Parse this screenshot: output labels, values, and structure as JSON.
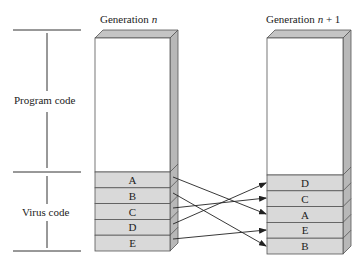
{
  "diagram": {
    "left_column": {
      "title": "Generation ",
      "title_var": "n",
      "blocks": [
        "A",
        "B",
        "C",
        "D",
        "E"
      ]
    },
    "right_column": {
      "title": "Generation ",
      "title_var": "n",
      "title_suffix": " + 1",
      "blocks": [
        "D",
        "C",
        "A",
        "E",
        "B"
      ]
    },
    "brackets": {
      "program_code": "Program code",
      "virus_code": "Virus code"
    },
    "arrows": [
      {
        "from": "A",
        "to": "A"
      },
      {
        "from": "B",
        "to": "B"
      },
      {
        "from": "C",
        "to": "C"
      },
      {
        "from": "D",
        "to": "D"
      },
      {
        "from": "E",
        "to": "E"
      }
    ],
    "colors": {
      "block_fill": "#d9d9d9",
      "side_fill": "#b8b8b8",
      "top_fill": "#c4c4c4",
      "outline": "#555555",
      "line": "#333333"
    }
  }
}
